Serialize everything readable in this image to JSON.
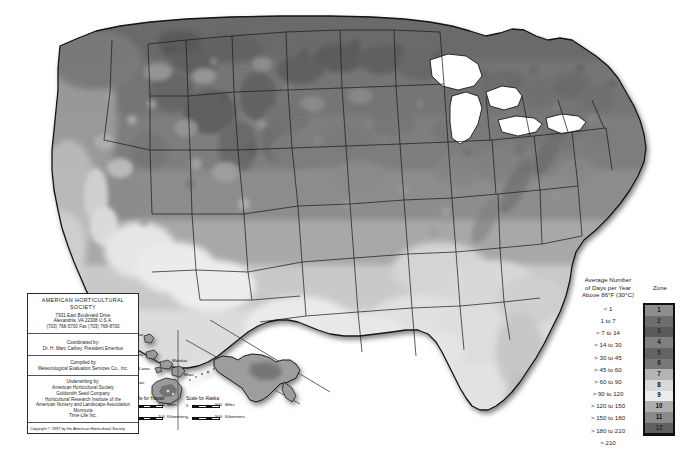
{
  "map": {
    "title": "AHS Plant Heat-Zone Map of the United States",
    "background_color": "#ffffff",
    "border_color": "#1a1a1a"
  },
  "legend": {
    "heading_lines": [
      "Average Number",
      "of Days per Year",
      "Above 86°F (30°C)"
    ],
    "heading_text": "Average Number of Days per Year Above 86°F (30°C)",
    "zone_heading": "Zone",
    "entries": [
      {
        "range": "< 1",
        "zone": "1",
        "color": "#8e8e8e",
        "text_color": "#1a1a1a"
      },
      {
        "range": "1 to 7",
        "zone": "2",
        "color": "#6d6d6d",
        "text_color": "#2a2a2a"
      },
      {
        "range": "> 7 to 14",
        "zone": "3",
        "color": "#5a5a5a",
        "text_color": "#303030"
      },
      {
        "range": "> 14 to 30",
        "zone": "4",
        "color": "#808080",
        "text_color": "#1a1a1a"
      },
      {
        "range": "> 30 to 45",
        "zone": "5",
        "color": "#646464",
        "text_color": "#2e2e2e"
      },
      {
        "range": "> 45 to 60",
        "zone": "6",
        "color": "#787878",
        "text_color": "#202020"
      },
      {
        "range": "> 60 to 90",
        "zone": "7",
        "color": "#b4b4b4",
        "text_color": "#141414"
      },
      {
        "range": "> 90 to 120",
        "zone": "8",
        "color": "#d8d8d8",
        "text_color": "#101010"
      },
      {
        "range": "> 120 to 150",
        "zone": "9",
        "color": "#ececec",
        "text_color": "#101010"
      },
      {
        "range": "> 150 to 180",
        "zone": "10",
        "color": "#aeaeae",
        "text_color": "#121212"
      },
      {
        "range": "> 180 to 210",
        "zone": "11",
        "color": "#8a8a8a",
        "text_color": "#151515"
      },
      {
        "range": "> 210",
        "zone": "12",
        "color": "#606060",
        "text_color": "#2c2c2c"
      }
    ]
  },
  "info_box": {
    "organization": "AMERICAN HORTICULTURAL SOCIETY",
    "address_lines": [
      "7931 East Boulevard Drive",
      "Alexandria, VA 22308 U.S.A.",
      "(703) 768-5700 Fax (703) 768-8700"
    ],
    "coordinated_by_label": "Coordinated by:",
    "coordinated_by_name": "Dr. H. Marc Cathey, President Emeritus",
    "compiled_by_label": "Compiled by",
    "compiled_by_name": "Meteorological Evaluation Services Co., Inc.",
    "underwriting_label": "Underwriting by:",
    "underwriters": [
      "American Horticultural Society",
      "Goldsmith Seed Company",
      "Horticultural Research Institute of the",
      "American Nursery and Landscape Association",
      "Monrovia",
      "Time-Life Inc."
    ],
    "copyright": "Copyright © 1997 by the American Horticultural Society"
  },
  "insets": {
    "hawaii": {
      "name": "Hawaii",
      "island_labels": [
        "Kauai",
        "Oahu",
        "Molokai",
        "Lanai",
        "Maui",
        "Hawaii"
      ],
      "scale_title": "Scale for Hawaii",
      "scale_zero": "0",
      "scale_miles_value": "100",
      "scale_miles_unit": "Miles",
      "scale_km_value": "100",
      "scale_km_unit": "Kilometers"
    },
    "alaska": {
      "name": "Alaska",
      "scale_title": "Scale for Alaska",
      "scale_zero": "0",
      "scale_miles_value": "500",
      "scale_miles_unit": "Miles",
      "scale_km_value": "500",
      "scale_km_unit": "Kilometers"
    }
  },
  "chart_data": {
    "type": "heatmap",
    "subtitle": "Average Number of Days per Year Above 86°F (30°C)",
    "legend_position": "right",
    "grid": false,
    "categories": [
      "1",
      "2",
      "3",
      "4",
      "5",
      "6",
      "7",
      "8",
      "9",
      "10",
      "11",
      "12"
    ],
    "bin_labels": [
      "< 1",
      "1 to 7",
      "> 7 to 14",
      "> 14 to 30",
      "> 30 to 45",
      "> 45 to 60",
      "> 60 to 90",
      "> 90 to 120",
      "> 120 to 150",
      "> 150 to 180",
      "> 180 to 210",
      "> 210"
    ],
    "colors": [
      "#8e8e8e",
      "#6d6d6d",
      "#5a5a5a",
      "#808080",
      "#646464",
      "#787878",
      "#b4b4b4",
      "#d8d8d8",
      "#ececec",
      "#aeaeae",
      "#8a8a8a",
      "#606060"
    ],
    "units": "days per year above 86°F",
    "regions": [
      {
        "name": "Pacific Northwest",
        "zone": 3
      },
      {
        "name": "Northern Rockies",
        "zone": 4
      },
      {
        "name": "Great Basin",
        "zone": 5
      },
      {
        "name": "Northern Plains",
        "zone": 5
      },
      {
        "name": "Upper Midwest",
        "zone": 4
      },
      {
        "name": "Northeast",
        "zone": 4
      },
      {
        "name": "Mid-Atlantic",
        "zone": 6
      },
      {
        "name": "Southeast",
        "zone": 8
      },
      {
        "name": "Florida Peninsula",
        "zone": 10
      },
      {
        "name": "Gulf Coast",
        "zone": 9
      },
      {
        "name": "Texas Interior",
        "zone": 9
      },
      {
        "name": "Desert Southwest",
        "zone": 11
      },
      {
        "name": "Central Valley California",
        "zone": 8
      },
      {
        "name": "Coastal California",
        "zone": 3
      },
      {
        "name": "Alaska",
        "zone": 1
      },
      {
        "name": "Hawaii",
        "zone": 6
      }
    ]
  }
}
